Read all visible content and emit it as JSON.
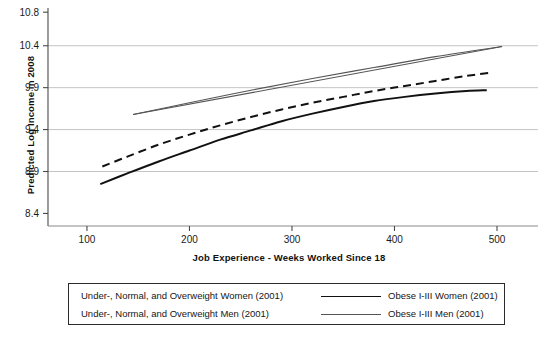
{
  "chart_data": {
    "type": "line",
    "title": "",
    "xlabel": "Job Experience - Weeks Worked Since 18",
    "ylabel": "Predicted Log Income in 2008",
    "xlim": [
      62,
      540
    ],
    "ylim": [
      8.25,
      10.85
    ],
    "xticks": [
      100,
      200,
      300,
      400,
      500
    ],
    "yticks": [
      8.4,
      8.9,
      9.4,
      9.9,
      10.4,
      10.8
    ],
    "xtick_labels": [
      "100",
      "200",
      "300",
      "400",
      "500"
    ],
    "ytick_labels": [
      "8.4",
      "8.9",
      "9.4",
      "9.9",
      "10.4",
      "10.8"
    ],
    "grid": "horizontal",
    "gridlines_at": [
      8.9,
      9.4,
      9.9,
      10.4
    ],
    "legend_position": "below",
    "series": [
      {
        "name": "Under-, Normal, and Overweight Women (2001)",
        "style": "dashed",
        "color": "#111111",
        "width": 2.0,
        "x": [
          115,
          140,
          170,
          200,
          230,
          260,
          290,
          320,
          350,
          380,
          410,
          440,
          470,
          495
        ],
        "y": [
          8.96,
          9.08,
          9.22,
          9.34,
          9.45,
          9.55,
          9.64,
          9.72,
          9.79,
          9.86,
          9.92,
          9.98,
          10.04,
          10.08
        ]
      },
      {
        "name": "Under-, Normal, and Overweight Men (2001)",
        "style": "solid",
        "color": "#555555",
        "width": 1.1,
        "x": [
          145,
          200,
          260,
          320,
          380,
          440,
          505
        ],
        "y": [
          9.58,
          9.72,
          9.87,
          10.01,
          10.14,
          10.27,
          10.39
        ]
      },
      {
        "name": "Obese I-III Women (2001)",
        "style": "solid",
        "color": "#111111",
        "width": 2.0,
        "x": [
          113,
          140,
          170,
          200,
          230,
          260,
          290,
          320,
          350,
          380,
          410,
          440,
          470,
          490
        ],
        "y": [
          8.75,
          8.88,
          9.02,
          9.15,
          9.28,
          9.39,
          9.5,
          9.59,
          9.67,
          9.74,
          9.79,
          9.83,
          9.86,
          9.87
        ]
      },
      {
        "name": "Obese I-III Men (2001)",
        "style": "solid",
        "color": "#555555",
        "width": 1.1,
        "x": [
          145,
          505
        ],
        "y": [
          9.58,
          10.39
        ]
      }
    ]
  },
  "axis": {
    "ylabel": "Predicted Log Income in 2008",
    "xlabel": "Job Experience - Weeks Worked Since 18",
    "ytick_labels": [
      "10.8",
      "10.4",
      "9.9",
      "9.4",
      "8.9",
      "8.4"
    ],
    "xtick_labels": [
      "100",
      "200",
      "300",
      "400",
      "500"
    ]
  },
  "legend": {
    "rows": [
      {
        "left_label": "Under-, Normal, and Overweight Women (2001)",
        "right_label": "Obese I-III Women (2001)",
        "right_swatch": "thick-solid-black"
      },
      {
        "left_label": "Under-, Normal, and Overweight Men (2001)",
        "right_label": "Obese I-III Men (2001)",
        "right_swatch": "thin-solid-gray"
      }
    ]
  },
  "colors": {
    "series_women": "#111111",
    "series_men": "#555555",
    "gridline": "#bdbdbd",
    "axis": "#4a4a4a",
    "background": "#ffffff"
  }
}
